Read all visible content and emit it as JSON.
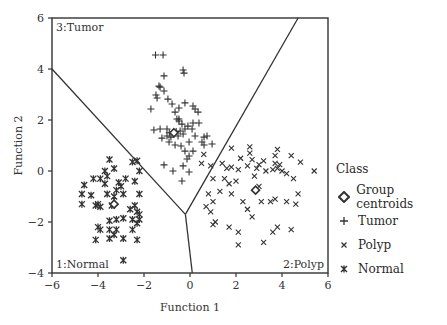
{
  "chart_data": {
    "type": "scatter",
    "title": "",
    "xlabel": "Function 1",
    "ylabel": "Function 2",
    "xlim": [
      -6,
      6
    ],
    "ylim": [
      -4,
      6
    ],
    "xticks": [
      -6,
      -4,
      -2,
      0,
      2,
      4,
      6
    ],
    "yticks": [
      -4,
      -2,
      0,
      2,
      4,
      6
    ],
    "grid": false,
    "legend_position": "right",
    "legend_title": "Class",
    "legend": [
      "Group centroids",
      "Tumor",
      "Polyp",
      "Normal"
    ],
    "region_labels": [
      {
        "text": "3:Tumor",
        "position": "top-left"
      },
      {
        "text": "1:Normal",
        "position": "bottom-left"
      },
      {
        "text": "2:Polyp",
        "position": "bottom-right"
      }
    ],
    "boundaries": [
      [
        [
          -6,
          4.0
        ],
        [
          -0.2,
          -1.7
        ]
      ],
      [
        [
          -0.2,
          -1.7
        ],
        [
          0.1,
          -4.0
        ]
      ],
      [
        [
          -0.2,
          -1.7
        ],
        [
          4.7,
          6.0
        ]
      ]
    ],
    "series": [
      {
        "name": "Tumor",
        "marker": "plus",
        "points": [
          [
            -1.5,
            4.55
          ],
          [
            -1.17,
            4.55
          ],
          [
            -1.13,
            3.73
          ],
          [
            -0.3,
            3.96
          ],
          [
            -0.26,
            3.84
          ],
          [
            -1.35,
            3.33
          ],
          [
            -1.3,
            3.29
          ],
          [
            -1.13,
            3.14
          ],
          [
            -1.48,
            2.98
          ],
          [
            -1.43,
            2.86
          ],
          [
            -0.96,
            2.82
          ],
          [
            -1.7,
            2.43
          ],
          [
            -0.78,
            2.63
          ],
          [
            -0.65,
            2.31
          ],
          [
            -0.48,
            2.47
          ],
          [
            -0.22,
            2.67
          ],
          [
            0.13,
            2.55
          ],
          [
            0.22,
            2.43
          ],
          [
            0.35,
            2.31
          ],
          [
            -0.48,
            2.04
          ],
          [
            0.13,
            1.88
          ],
          [
            -1.3,
            1.65
          ],
          [
            -1.0,
            1.65
          ],
          [
            -0.57,
            2.04
          ],
          [
            -0.48,
            1.96
          ],
          [
            -0.35,
            1.84
          ],
          [
            -0.43,
            1.57
          ],
          [
            -0.22,
            1.65
          ],
          [
            0.09,
            1.65
          ],
          [
            0.22,
            1.37
          ],
          [
            0.61,
            1.33
          ],
          [
            -0.04,
            1.14
          ],
          [
            0.52,
            1.14
          ],
          [
            0.74,
            1.37
          ],
          [
            0.96,
            1.06
          ],
          [
            -1.0,
            1.37
          ],
          [
            -0.91,
            1.14
          ],
          [
            -0.39,
            0.98
          ],
          [
            -0.22,
            0.78
          ],
          [
            -0.04,
            0.59
          ],
          [
            -0.13,
            0.47
          ],
          [
            -0.3,
            0.2
          ],
          [
            -1.13,
            0.24
          ],
          [
            -0.74,
            0.0
          ],
          [
            -0.35,
            -0.39
          ],
          [
            0.13,
            0.78
          ],
          [
            -0.65,
            1.02
          ],
          [
            -0.83,
            1.33
          ],
          [
            -0.52,
            1.37
          ],
          [
            -0.09,
            1.76
          ],
          [
            -1.22,
            1.29
          ],
          [
            -1.57,
            1.61
          ],
          [
            0.39,
            1.88
          ],
          [
            0.61,
            1.02
          ],
          [
            -0.04,
            -0.04
          ],
          [
            -0.3,
            1.45
          ],
          [
            -0.9,
            1.5
          ],
          [
            -0.6,
            1.55
          ]
        ]
      },
      {
        "name": "Polyp",
        "marker": "x",
        "points": [
          [
            0.6,
            0.65
          ],
          [
            0.9,
            0.2
          ],
          [
            1.8,
            0.9
          ],
          [
            2.6,
            0.95
          ],
          [
            2.6,
            0.7
          ],
          [
            2.7,
            0.45
          ],
          [
            3.2,
            0.4
          ],
          [
            3.7,
            0.6
          ],
          [
            3.8,
            0.85
          ],
          [
            4.4,
            0.6
          ],
          [
            4.8,
            0.35
          ],
          [
            5.4,
            0.0
          ],
          [
            1.4,
            0.3
          ],
          [
            1.6,
            0.1
          ],
          [
            1.8,
            0.15
          ],
          [
            2.1,
            0.05
          ],
          [
            2.5,
            0.2
          ],
          [
            2.9,
            0.1
          ],
          [
            3.3,
            0.0
          ],
          [
            3.6,
            0.05
          ],
          [
            3.8,
            0.1
          ],
          [
            4.0,
            0.0
          ],
          [
            4.2,
            -0.1
          ],
          [
            4.5,
            -0.3
          ],
          [
            3.9,
            0.25
          ],
          [
            3.7,
            0.3
          ],
          [
            1.0,
            -0.3
          ],
          [
            1.5,
            -0.3
          ],
          [
            1.7,
            -0.5
          ],
          [
            2.0,
            -0.4
          ],
          [
            2.8,
            -0.2
          ],
          [
            3.0,
            -0.6
          ],
          [
            1.3,
            -0.8
          ],
          [
            1.8,
            -0.9
          ],
          [
            0.8,
            -0.9
          ],
          [
            1.0,
            -1.2
          ],
          [
            0.7,
            -1.4
          ],
          [
            0.9,
            -1.6
          ],
          [
            2.3,
            -1.2
          ],
          [
            2.5,
            -1.5
          ],
          [
            3.1,
            -1.2
          ],
          [
            3.5,
            -1.2
          ],
          [
            3.7,
            -1.1
          ],
          [
            4.2,
            -1.2
          ],
          [
            4.7,
            -0.9
          ],
          [
            4.6,
            -1.3
          ],
          [
            1.0,
            -2.1
          ],
          [
            1.1,
            -2.0
          ],
          [
            1.7,
            -2.2
          ],
          [
            2.1,
            -2.4
          ],
          [
            2.7,
            -1.8
          ],
          [
            3.6,
            -2.4
          ],
          [
            3.8,
            -2.2
          ],
          [
            4.4,
            -2.3
          ],
          [
            3.2,
            -2.8
          ],
          [
            2.1,
            -2.9
          ],
          [
            0.5,
            0.3
          ],
          [
            2.2,
            0.5
          ],
          [
            3.0,
            0.25
          ]
        ]
      },
      {
        "name": "Normal",
        "marker": "asterisk",
        "points": [
          [
            -3.5,
            0.45
          ],
          [
            -3.7,
            0.0
          ],
          [
            -3.9,
            -0.3
          ],
          [
            -3.6,
            -0.2
          ],
          [
            -4.2,
            -0.3
          ],
          [
            -4.6,
            -0.55
          ],
          [
            -4.7,
            -0.9
          ],
          [
            -4.3,
            -0.95
          ],
          [
            -3.6,
            -0.9
          ],
          [
            -3.2,
            -0.75
          ],
          [
            -3.0,
            -0.6
          ],
          [
            -2.8,
            -0.3
          ],
          [
            -2.5,
            0.35
          ],
          [
            -2.3,
            0.4
          ],
          [
            -2.2,
            0.0
          ],
          [
            -2.4,
            -0.4
          ],
          [
            -2.2,
            -0.9
          ],
          [
            -2.9,
            -0.9
          ],
          [
            -3.3,
            -1.0
          ],
          [
            -3.4,
            -1.35
          ],
          [
            -4.7,
            -1.3
          ],
          [
            -4.1,
            -1.35
          ],
          [
            -3.9,
            -1.4
          ],
          [
            -4.0,
            -1.3
          ],
          [
            -2.4,
            -1.35
          ],
          [
            -2.6,
            -1.5
          ],
          [
            -2.3,
            -1.6
          ],
          [
            -2.2,
            -1.7
          ],
          [
            -2.5,
            -1.9
          ],
          [
            -2.2,
            -1.9
          ],
          [
            -2.3,
            -2.05
          ],
          [
            -3.5,
            -1.95
          ],
          [
            -3.2,
            -1.9
          ],
          [
            -2.9,
            -1.85
          ],
          [
            -4.0,
            -2.2
          ],
          [
            -3.9,
            -2.3
          ],
          [
            -3.5,
            -2.3
          ],
          [
            -3.2,
            -2.3
          ],
          [
            -3.3,
            -2.5
          ],
          [
            -2.5,
            -2.3
          ],
          [
            -4.1,
            -2.7
          ],
          [
            -3.5,
            -2.65
          ],
          [
            -2.9,
            -2.65
          ],
          [
            -2.3,
            -2.7
          ],
          [
            -2.9,
            -3.5
          ],
          [
            -3.3,
            0.1
          ],
          [
            -3.1,
            -0.45
          ],
          [
            -3.7,
            -0.5
          ]
        ]
      },
      {
        "name": "Group centroids",
        "marker": "diamond",
        "points": [
          [
            -3.3,
            -1.3
          ],
          [
            -0.7,
            1.5
          ],
          [
            2.85,
            -0.75
          ]
        ]
      }
    ]
  },
  "legend": {
    "title": "Class",
    "items": [
      "Group centroids",
      "Tumor",
      "Polyp",
      "Normal"
    ]
  }
}
